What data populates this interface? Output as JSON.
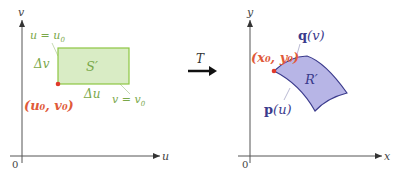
{
  "colors": {
    "axis": "#555555",
    "green_stroke": "#8dc641",
    "green_fill": "#d9ecc5",
    "green_text": "#7aa84a",
    "red": "#e03a2a",
    "red_text": "#e05a3a",
    "purple_stroke": "#3a3a8c",
    "purple_fill": "#b7b5e6",
    "purple_text": "#3a3a8c",
    "leader": "#a8a8c8"
  },
  "left_panel": {
    "axes": {
      "x_label": "u",
      "y_label": "v",
      "origin_label": "0"
    },
    "region_label": "S′",
    "u_line_label": "u = u",
    "u_line_sub": "0",
    "v_line_label": "v = v",
    "v_line_sub": "0",
    "delta_v": "Δv",
    "delta_u": "Δu",
    "corner_point": "(u₀, v₀)"
  },
  "transform": {
    "label": "T"
  },
  "right_panel": {
    "axes": {
      "x_label": "x",
      "y_label": "y",
      "origin_label": "0"
    },
    "region_label": "R′",
    "q_label": "q",
    "q_arg": "(v)",
    "p_label": "p",
    "p_arg": "(u)",
    "corner_point": "(x₀, y₀)"
  }
}
